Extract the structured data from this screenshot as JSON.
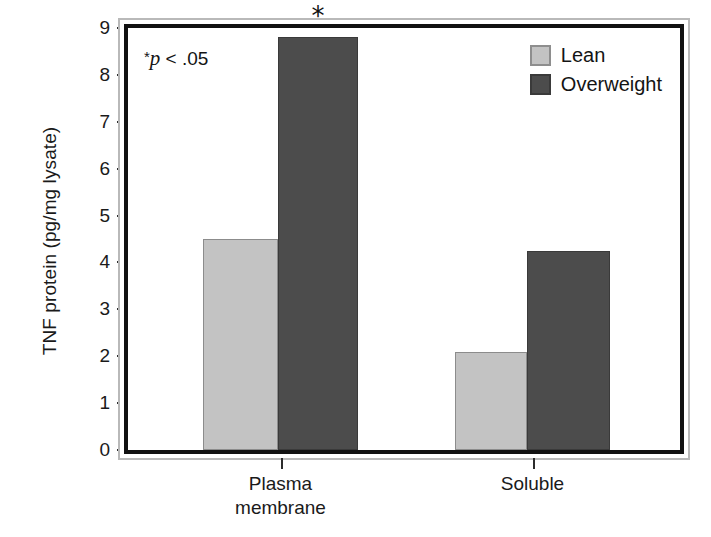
{
  "chart_data": {
    "type": "bar",
    "title": "",
    "subtitle": "",
    "xlabel": "",
    "ylabel": "TNF protein (pg/mg lysate)",
    "categories": [
      "Plasma membrane",
      "Soluble"
    ],
    "category_lines": [
      [
        "Plasma",
        "membrane"
      ],
      [
        "Soluble"
      ]
    ],
    "series": [
      {
        "name": "Lean",
        "color": "#c3c3c3",
        "values": [
          4.5,
          2.1
        ]
      },
      {
        "name": "Overweight",
        "color": "#4c4c4c",
        "values": [
          8.8,
          4.25
        ]
      }
    ],
    "ylim": [
      0,
      9
    ],
    "yticks": [
      0,
      1,
      2,
      3,
      4,
      5,
      6,
      7,
      8,
      9
    ],
    "ytick_labels": [
      "0",
      "1",
      "2",
      "3",
      "4",
      "5",
      "6",
      "7",
      "8",
      "9"
    ],
    "grid": false,
    "legend_position": "top-right",
    "annotations": [
      {
        "name": "p-value-note",
        "text": "*p < .05",
        "star": "*",
        "italic_part": "p",
        "rest": " < .05"
      },
      {
        "name": "significance-star",
        "text": "*",
        "applies_to": {
          "category": "Plasma membrane",
          "series": "Overweight"
        }
      }
    ]
  },
  "legend": {
    "items": [
      {
        "label": "Lean",
        "color": "#c3c3c3"
      },
      {
        "label": "Overweight",
        "color": "#4c4c4c"
      }
    ]
  },
  "axes": {
    "y_title": "TNF protein (pg/mg lysate)",
    "y_ticks": [
      "9",
      "8",
      "7",
      "6",
      "5",
      "4",
      "3",
      "2",
      "1",
      "0"
    ],
    "x_groups": [
      {
        "line1": "Plasma",
        "line2": "membrane"
      },
      {
        "line1": "Soluble",
        "line2": ""
      }
    ]
  },
  "annotation": {
    "p_star": "*",
    "p_italic": "p",
    "p_rest": " < .05",
    "sig_star": "*"
  },
  "colors": {
    "lean": "#c3c3c3",
    "overweight": "#4c4c4c",
    "frame": "#111111",
    "frame_outer": "#b9b9b9",
    "text": "#1a1a1a"
  }
}
